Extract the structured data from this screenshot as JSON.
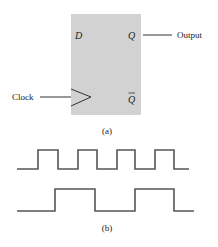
{
  "flipflop": {
    "input_label": "D",
    "output_label": "Q",
    "inverted_output_label": "Q",
    "clock_label": "Clock",
    "output_line_label": "Output",
    "caption": "(a)",
    "box_color": "#d2d2d2"
  },
  "waveforms": {
    "caption": "(b)",
    "line_color": "#555555",
    "series": [
      {
        "name": "clock",
        "points": "17,169 38,169 38,150 58,150 58,169 78,169 78,150 97,150 97,169 117,169 117,150 135,150 135,169 155,169 155,150 174,150 174,169 189,169"
      },
      {
        "name": "output",
        "points": "17,211 55,211 55,189 95,189 95,211 135,211 135,189 174,189 174,211 194,211"
      }
    ]
  }
}
